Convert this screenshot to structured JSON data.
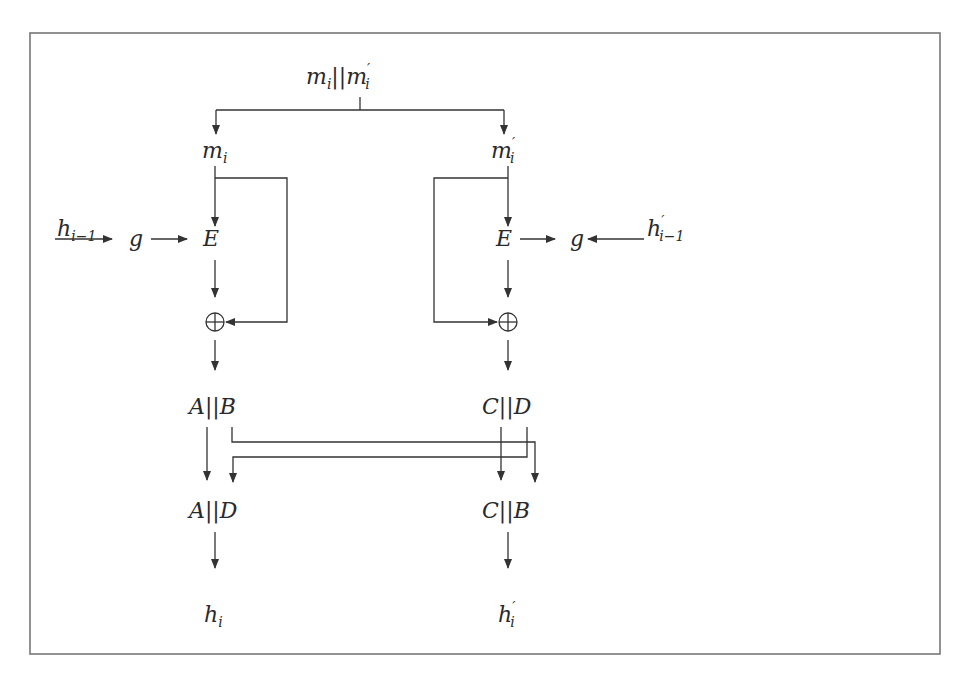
{
  "diagram": {
    "type": "block-diagram",
    "top_input": {
      "base": "m",
      "sub": "i",
      "sep": "||",
      "base2": "m",
      "prime2": "′",
      "sub2": "i"
    },
    "left": {
      "message": {
        "base": "m",
        "sub": "i"
      },
      "chain_input": {
        "base": "h",
        "sub": "i−1"
      },
      "g": "g",
      "E": "E",
      "xor": "⊕",
      "split": "A||B",
      "swapped": "A||D",
      "output": {
        "base": "h",
        "sub": "i"
      }
    },
    "right": {
      "message": {
        "base": "m",
        "prime": "′",
        "sub": "i"
      },
      "chain_input": {
        "base": "h",
        "prime": "′",
        "sub": "i−1"
      },
      "g": "g",
      "E": "E",
      "xor": "⊕",
      "split": "C||D",
      "swapped": "C||B",
      "output": {
        "base": "h",
        "prime": "′",
        "sub": "i"
      }
    },
    "edges": [
      "m_i||m'_i -> m_i",
      "m_i||m'_i -> m'_i",
      "h_{i-1} -> g",
      "g -> E (left)",
      "m_i -> E (left)",
      "m_i -> ⊕ (left, feed-forward)",
      "E (left) -> ⊕ (left)",
      "⊕ (left) -> A||B",
      "h'_{i-1} -> g (right)",
      "E (right) -> g (right)",
      "m'_i -> E (right)",
      "m'_i -> ⊕ (right, feed-forward)",
      "E (right) -> ⊕ (right)",
      "⊕ (right) -> C||D",
      "A -> A||D",
      "D -> A||D",
      "C -> C||B",
      "B -> C||B",
      "A||D -> h_i",
      "C||B -> h'_i"
    ]
  }
}
